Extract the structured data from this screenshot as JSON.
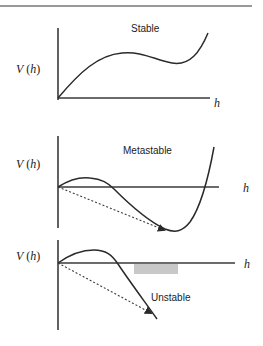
{
  "figure": {
    "panels": [
      {
        "id": "stable",
        "title": "Stable",
        "ylabel_italic": "V",
        "ylabel_paren_open": " (",
        "ylabel_arg": "h",
        "ylabel_paren_close": ")",
        "xlabel": "h",
        "has_tunneling_arrow": false,
        "has_shaded_region": false
      },
      {
        "id": "metastable",
        "title": "Metastable",
        "ylabel_italic": "V",
        "ylabel_paren_open": " (",
        "ylabel_arg": "h",
        "ylabel_paren_close": ")",
        "xlabel": "h",
        "has_tunneling_arrow": true,
        "has_shaded_region": false
      },
      {
        "id": "unstable",
        "title": "Unstable",
        "ylabel_italic": "V",
        "ylabel_paren_open": " (",
        "ylabel_arg": "h",
        "ylabel_paren_close": ")",
        "xlabel": "h",
        "has_tunneling_arrow": true,
        "has_shaded_region": true
      }
    ],
    "colors": {
      "line": "#2a2a2a",
      "shaded_region": "#c8c8c8"
    }
  }
}
